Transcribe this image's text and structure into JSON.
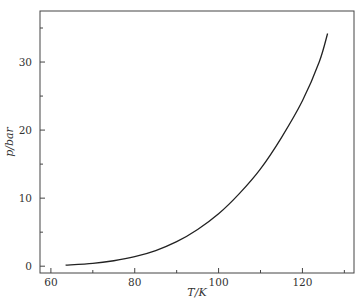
{
  "chart_data": {
    "type": "line",
    "title": "",
    "xlabel": "T/K",
    "ylabel": "p/bar",
    "xlim": [
      57.4,
      132.3
    ],
    "ylim": [
      -1.0,
      37.5
    ],
    "grid": false,
    "legend": null,
    "x_ticks": [
      60,
      80,
      100,
      120
    ],
    "x_minor_ticks": [
      70,
      90,
      110,
      130
    ],
    "y_ticks": [
      0,
      10,
      20,
      30
    ],
    "y_minor_ticks": [
      5,
      15,
      25,
      35
    ],
    "series": [
      {
        "name": "vapor pressure",
        "x": [
          63.5,
          70,
          75,
          80,
          85,
          90,
          95,
          100,
          105,
          110,
          115,
          120,
          124,
          126
        ],
        "y": [
          0.15,
          0.4,
          0.8,
          1.4,
          2.3,
          3.6,
          5.4,
          7.7,
          10.7,
          14.3,
          18.9,
          24.3,
          30.0,
          34.2
        ],
        "color": "#222222"
      }
    ]
  }
}
